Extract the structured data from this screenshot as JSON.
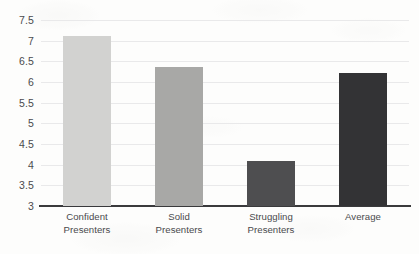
{
  "chart_data": {
    "type": "bar",
    "title": "",
    "subtitle": "",
    "xlabel": "",
    "ylabel": "",
    "categories": [
      "Confident Presenters",
      "Solid Presenters",
      "Struggling Presenters",
      "Average"
    ],
    "category_lines": [
      [
        "Confident",
        "Presenters"
      ],
      [
        "Solid",
        "Presenters"
      ],
      [
        "Struggling",
        "Presenters"
      ],
      [
        "Average"
      ]
    ],
    "values": [
      7.12,
      6.37,
      4.1,
      6.22
    ],
    "ylim": [
      3,
      7.5
    ],
    "ytick_labels": [
      "7.5",
      "7",
      "6.5",
      "6",
      "5.5",
      "5",
      "4.5",
      "4",
      "3.5",
      "3"
    ],
    "ytick_values": [
      7.5,
      7,
      6.5,
      6,
      5.5,
      5,
      4.5,
      4,
      3.5,
      3
    ],
    "ytick_step": 0.5,
    "grid": true,
    "grid_axis": "y",
    "legend": false,
    "legend_position": "none",
    "bar_colors": [
      "#d2d2d0",
      "#a8a8a6",
      "#4e4e50",
      "#333335"
    ],
    "grid_color": "#e9e9ea",
    "axis_color": "#3a3a3c",
    "text_color": "#4a4a4d",
    "background_color": "#fdfdfc"
  }
}
